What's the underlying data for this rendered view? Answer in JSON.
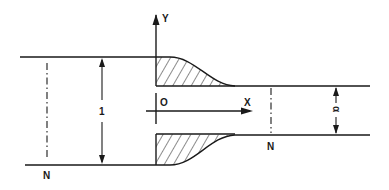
{
  "diagram": {
    "type": "nozzle-contraction-schematic",
    "colors": {
      "line": "#1a1a1a",
      "background": "#ffffff"
    },
    "axes": {
      "y_label": "Y",
      "x_label": "X",
      "origin_label": "O"
    },
    "sections": {
      "left_section_label": "N",
      "right_section_label": "N"
    },
    "dimensions": {
      "inlet_width_label": "1",
      "outlet_width_label": "α"
    }
  }
}
